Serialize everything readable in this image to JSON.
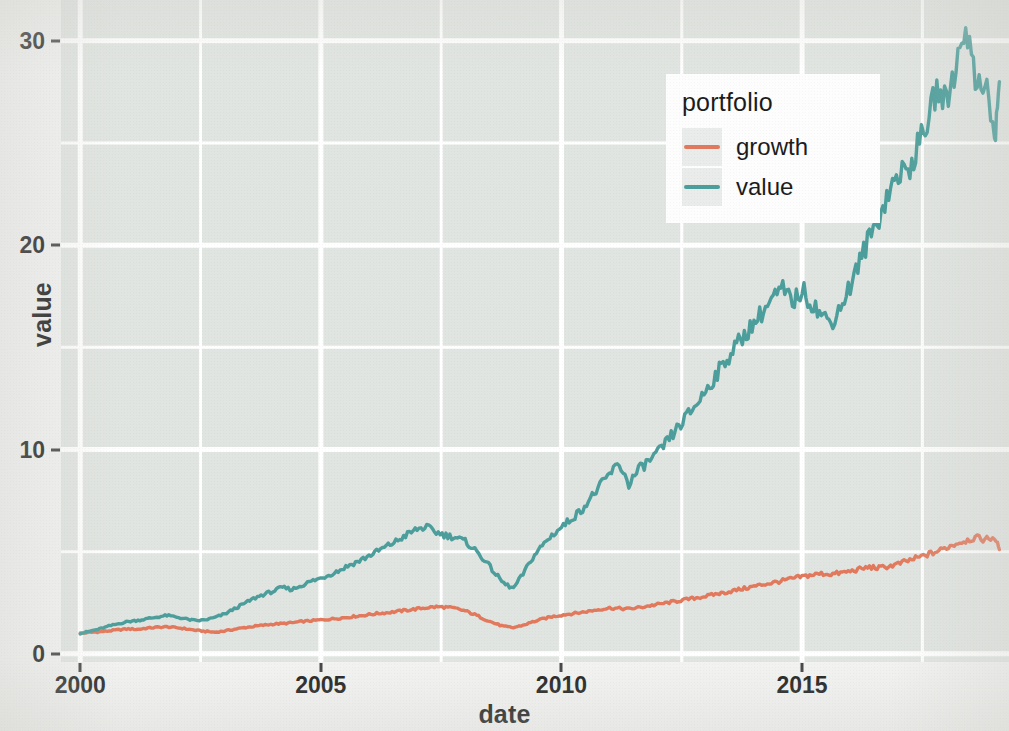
{
  "chart_data": {
    "type": "line",
    "title": "",
    "xlabel": "date",
    "ylabel": "value",
    "xlim": [
      1999.6,
      2019.3
    ],
    "ylim": [
      -0.4,
      32.0
    ],
    "grid": true,
    "x_ticks": [
      "2000",
      "2005",
      "2010",
      "2015"
    ],
    "x_tick_values": [
      2000,
      2005,
      2010,
      2015
    ],
    "y_ticks": [
      "0",
      "10",
      "20",
      "30"
    ],
    "y_tick_values": [
      0,
      10,
      20,
      30
    ],
    "x_minor_values": [
      2002.5,
      2007.5,
      2012.5,
      2017.5
    ],
    "y_minor_values": [
      5,
      15,
      25
    ],
    "legend": {
      "title": "portfolio",
      "position": "inside-top-right",
      "entries": [
        {
          "name": "growth",
          "color": "#e2795c"
        },
        {
          "name": "value",
          "color": "#4b9e9b"
        }
      ]
    },
    "colors": {
      "growth": "#e2795c",
      "value": "#4b9e9b"
    },
    "panel_background": "#e1e5e1",
    "grid_color": "#ffffff",
    "series": [
      {
        "name": "growth",
        "color": "#e2795c",
        "x": [
          2000.0,
          2000.2,
          2000.4,
          2000.6,
          2000.8,
          2001.0,
          2001.2,
          2001.4,
          2001.6,
          2001.8,
          2002.0,
          2002.2,
          2002.4,
          2002.6,
          2002.8,
          2003.0,
          2003.2,
          2003.4,
          2003.6,
          2003.8,
          2004.0,
          2004.2,
          2004.4,
          2004.6,
          2004.8,
          2005.0,
          2005.2,
          2005.4,
          2005.6,
          2005.8,
          2006.0,
          2006.2,
          2006.4,
          2006.6,
          2006.8,
          2007.0,
          2007.2,
          2007.4,
          2007.6,
          2007.8,
          2008.0,
          2008.2,
          2008.4,
          2008.6,
          2008.8,
          2009.0,
          2009.2,
          2009.4,
          2009.6,
          2009.8,
          2010.0,
          2010.2,
          2010.4,
          2010.6,
          2010.8,
          2011.0,
          2011.2,
          2011.4,
          2011.6,
          2011.8,
          2012.0,
          2012.2,
          2012.4,
          2012.6,
          2012.8,
          2013.0,
          2013.2,
          2013.4,
          2013.6,
          2013.8,
          2014.0,
          2014.2,
          2014.4,
          2014.6,
          2014.8,
          2015.0,
          2015.2,
          2015.4,
          2015.6,
          2015.8,
          2016.0,
          2016.2,
          2016.4,
          2016.6,
          2016.8,
          2017.0,
          2017.2,
          2017.4,
          2017.6,
          2017.8,
          2018.0,
          2018.2,
          2018.4,
          2018.6,
          2018.8,
          2019.0,
          2019.1
        ],
        "y": [
          1.0,
          1.05,
          1.08,
          1.12,
          1.18,
          1.22,
          1.2,
          1.26,
          1.3,
          1.32,
          1.28,
          1.22,
          1.15,
          1.1,
          1.06,
          1.12,
          1.2,
          1.28,
          1.34,
          1.4,
          1.45,
          1.48,
          1.52,
          1.58,
          1.62,
          1.66,
          1.7,
          1.75,
          1.8,
          1.86,
          1.92,
          1.98,
          2.02,
          2.08,
          2.14,
          2.2,
          2.26,
          2.3,
          2.28,
          2.22,
          2.1,
          1.92,
          1.7,
          1.5,
          1.34,
          1.28,
          1.4,
          1.56,
          1.7,
          1.82,
          1.9,
          1.96,
          2.02,
          2.1,
          2.18,
          2.24,
          2.22,
          2.2,
          2.26,
          2.34,
          2.42,
          2.5,
          2.58,
          2.66,
          2.74,
          2.82,
          2.92,
          3.0,
          3.1,
          3.2,
          3.3,
          3.4,
          3.48,
          3.58,
          3.68,
          3.78,
          3.86,
          3.92,
          3.9,
          3.96,
          4.04,
          4.14,
          4.24,
          4.2,
          4.28,
          4.4,
          4.55,
          4.7,
          4.85,
          5.0,
          5.2,
          5.4,
          5.55,
          5.68,
          5.6,
          5.7,
          5.1
        ]
      },
      {
        "name": "value",
        "color": "#4b9e9b",
        "x": [
          2000.0,
          2000.2,
          2000.4,
          2000.6,
          2000.8,
          2001.0,
          2001.2,
          2001.4,
          2001.6,
          2001.8,
          2002.0,
          2002.2,
          2002.4,
          2002.6,
          2002.8,
          2003.0,
          2003.2,
          2003.4,
          2003.6,
          2003.8,
          2004.0,
          2004.2,
          2004.4,
          2004.6,
          2004.8,
          2005.0,
          2005.2,
          2005.4,
          2005.6,
          2005.8,
          2006.0,
          2006.2,
          2006.4,
          2006.6,
          2006.8,
          2007.0,
          2007.2,
          2007.4,
          2007.6,
          2007.8,
          2008.0,
          2008.2,
          2008.4,
          2008.6,
          2008.8,
          2009.0,
          2009.2,
          2009.4,
          2009.6,
          2009.8,
          2010.0,
          2010.2,
          2010.4,
          2010.6,
          2010.8,
          2011.0,
          2011.2,
          2011.4,
          2011.6,
          2011.8,
          2012.0,
          2012.2,
          2012.4,
          2012.6,
          2012.8,
          2013.0,
          2013.2,
          2013.4,
          2013.6,
          2013.8,
          2014.0,
          2014.2,
          2014.4,
          2014.6,
          2014.8,
          2015.0,
          2015.2,
          2015.4,
          2015.6,
          2015.8,
          2016.0,
          2016.2,
          2016.4,
          2016.6,
          2016.8,
          2017.0,
          2017.2,
          2017.4,
          2017.6,
          2017.8,
          2018.0,
          2018.2,
          2018.4,
          2018.6,
          2018.8,
          2019.0,
          2019.1
        ],
        "y": [
          1.0,
          1.1,
          1.22,
          1.36,
          1.48,
          1.58,
          1.64,
          1.72,
          1.8,
          1.88,
          1.8,
          1.7,
          1.62,
          1.66,
          1.78,
          1.95,
          2.2,
          2.45,
          2.7,
          2.9,
          3.05,
          3.25,
          3.15,
          3.35,
          3.55,
          3.7,
          3.9,
          4.1,
          4.35,
          4.55,
          4.8,
          5.05,
          5.3,
          5.55,
          5.85,
          6.1,
          6.2,
          5.95,
          5.8,
          5.7,
          5.5,
          5.1,
          4.6,
          4.0,
          3.45,
          3.2,
          3.9,
          4.7,
          5.3,
          5.8,
          6.2,
          6.6,
          7.0,
          7.6,
          8.2,
          8.8,
          9.3,
          8.3,
          9.0,
          9.4,
          9.8,
          10.4,
          11.0,
          11.6,
          12.2,
          12.9,
          13.6,
          14.3,
          15.0,
          15.6,
          16.2,
          16.8,
          17.4,
          17.8,
          17.2,
          17.8,
          17.2,
          16.6,
          16.2,
          17.0,
          18.0,
          19.2,
          20.4,
          21.4,
          22.6,
          23.5,
          23.6,
          24.8,
          26.0,
          27.6,
          27.0,
          28.8,
          30.9,
          28.0,
          28.2,
          25.0,
          28.0
        ]
      }
    ],
    "key_events": [
      {
        "label": "dot-com / early-2000s trough",
        "approx_x": 2002.7,
        "growth": 1.06,
        "value": 1.62
      },
      {
        "label": "pre-crisis peak",
        "approx_x": 2007.2,
        "growth": 2.3,
        "value": 6.2
      },
      {
        "label": "financial-crisis trough",
        "approx_x": 2009.0,
        "growth": 1.28,
        "value": 3.2
      },
      {
        "label": "2011 drawdown",
        "approx_x": 2011.4,
        "growth": 2.2,
        "value": 8.3
      },
      {
        "label": "all-time high",
        "approx_x": 2018.4,
        "growth": 5.55,
        "value": 30.9
      },
      {
        "label": "final value",
        "approx_x": 2019.1,
        "growth": 5.1,
        "value": 28.0
      }
    ]
  }
}
